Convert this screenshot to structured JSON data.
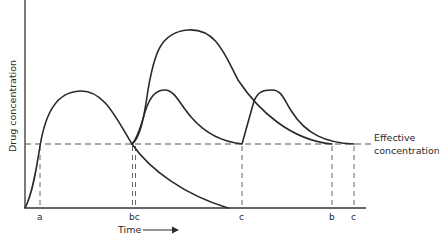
{
  "diagram": {
    "title": "",
    "y_axis_label": "Drug concentration",
    "x_axis_label": "Time",
    "x_axis_arrow": "arrow-right",
    "threshold": {
      "label_line1": "Effective",
      "label_line2": "concentration"
    },
    "markers": [
      {
        "label": "a"
      },
      {
        "label": "bc"
      },
      {
        "label": "c"
      },
      {
        "label": "b"
      },
      {
        "label": "c"
      }
    ],
    "curves": [
      {
        "name": "a",
        "description": "Single dose: rises above effective concentration at a, falls below at bc"
      },
      {
        "name": "b",
        "description": "Second dose given at bc producing high peak, falls to effective concentration at b"
      },
      {
        "name": "c",
        "description": "Repeated smaller doses at bc and c, falls to effective concentration at final c"
      }
    ],
    "colors": {
      "line": "#2a2a2a",
      "dashed": "#666666",
      "background": "#ffffff"
    }
  }
}
